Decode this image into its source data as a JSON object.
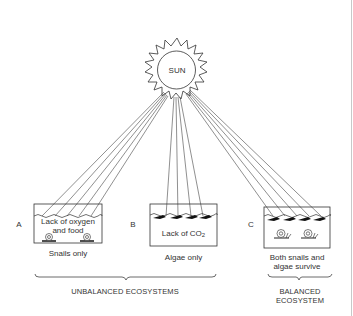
{
  "sun": {
    "label": "SUN"
  },
  "ecosystems": [
    {
      "letter": "A",
      "box_text_line1": "Lack of oxygen",
      "box_text_line2": "and food",
      "caption_line1": "Snails only",
      "caption_line2": "",
      "organisms": [
        "snail",
        "snail"
      ]
    },
    {
      "letter": "B",
      "box_text_main": "Lack of CO",
      "box_text_sub": "2",
      "caption_line1": "Algae only",
      "caption_line2": "",
      "organisms": [
        "algae",
        "algae",
        "algae",
        "algae"
      ]
    },
    {
      "letter": "C",
      "box_text_line1": "",
      "caption_line1": "Both snails and",
      "caption_line2": "algae survive",
      "organisms": [
        "algae",
        "algae",
        "algae",
        "algae",
        "snail",
        "snail"
      ]
    }
  ],
  "groups": [
    {
      "label": "UNBALANCED ECOSYSTEMS",
      "spans": [
        "A",
        "B"
      ]
    },
    {
      "label_line1": "BALANCED",
      "label_line2": "ECOSYSTEM",
      "spans": [
        "C"
      ]
    }
  ],
  "colors": {
    "line": "#333333",
    "background": "#ffffff"
  }
}
